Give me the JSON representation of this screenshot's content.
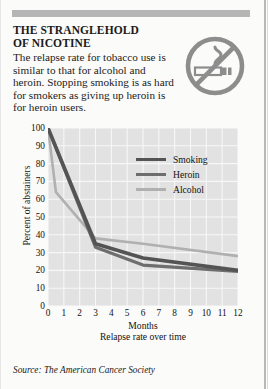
{
  "article": {
    "title_line1": "THE STRANGLEHOLD",
    "title_line2": "OF NICOTINE",
    "blurb": "The relapse rate for tobacco use is similar to that for alcohol and heroin. Stopping smoking is as hard for smokers as giving up heroin is for heroin users.",
    "icon": "no-smoking-icon",
    "source": "Source: The American Cancer Society"
  },
  "colors": {
    "plot_background": "#e2e2e2",
    "grid": "#f7f7f7",
    "smoking": "#545454",
    "heroin": "#6e6e6e",
    "alcohol": "#b0b0b0",
    "top_bar": "#b5b5b5",
    "text": "#1a1a1a"
  },
  "chart_data": {
    "type": "line",
    "title": "",
    "xlabel": "Months",
    "xsublabel": "Relapse rate over time",
    "ylabel": "Percent of abstainers",
    "xlim": [
      0,
      12
    ],
    "ylim": [
      0,
      100
    ],
    "xticks": [
      "0",
      "1",
      "2",
      "3",
      "4",
      "5",
      "6",
      "7",
      "8",
      "9",
      "10",
      "11",
      "12"
    ],
    "yticks": [
      "0",
      "10",
      "20",
      "30",
      "40",
      "50",
      "60",
      "70",
      "80",
      "90",
      "100"
    ],
    "grid": true,
    "legend_position": "upper right",
    "series": [
      {
        "name": "Smoking",
        "color": "#545454",
        "x": [
          0,
          3,
          6,
          12
        ],
        "values": [
          100,
          35,
          27,
          20
        ]
      },
      {
        "name": "Heroin",
        "color": "#6e6e6e",
        "x": [
          0,
          3,
          6,
          12
        ],
        "values": [
          100,
          33,
          23,
          19.5
        ]
      },
      {
        "name": "Alcohol",
        "color": "#b0b0b0",
        "x": [
          0,
          0.5,
          3,
          6,
          12
        ],
        "values": [
          100,
          64,
          38,
          35,
          28
        ]
      }
    ]
  }
}
